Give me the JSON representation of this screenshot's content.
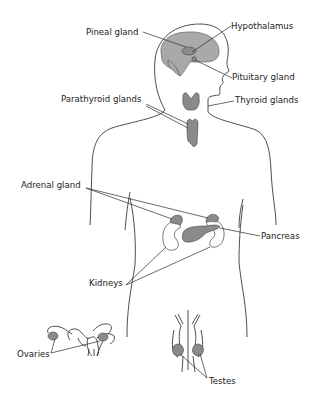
{
  "diagram": {
    "labels": {
      "pineal": "Pineal gland",
      "hypothalamus": "Hypothalamus",
      "pituitary": "Pituitary gland",
      "parathyroid": "Parathyroid glands",
      "thyroid": "Thyroid glands",
      "adrenal": "Adrenal gland",
      "pancreas": "Pancreas",
      "kidneys": "Kidneys",
      "ovaries": "Ovaries",
      "testes": "Testes"
    },
    "colors": {
      "outline": "#3a3a3a",
      "gland_fill": "#8a8a8a",
      "brain_fill": "#a9a9a9",
      "text": "#222222"
    }
  }
}
